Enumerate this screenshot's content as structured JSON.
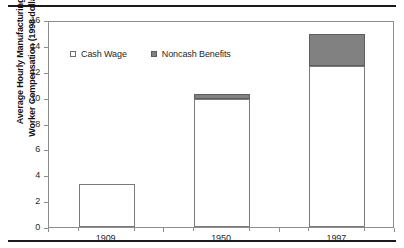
{
  "chart_data": {
    "type": "bar",
    "stacked": true,
    "title": "",
    "subtitle": "",
    "xlabel": "",
    "ylabel": "Average Hourly Manufacturing Worker Compensation (1998 dollars)",
    "ylabel_lines": [
      "Average Hourly Manufacturing",
      "Worker Compensation (1998 dollars)"
    ],
    "categories": [
      "1909",
      "1950",
      "1997"
    ],
    "series": [
      {
        "name": "Cash Wage",
        "values": [
          3.35,
          9.9,
          12.45
        ],
        "color": "#ffffff"
      },
      {
        "name": "Noncash Benefits",
        "values": [
          0.0,
          0.4,
          2.45
        ],
        "color": "#818181"
      }
    ],
    "totals": [
      3.35,
      10.3,
      14.9
    ],
    "ylim": [
      0,
      16
    ],
    "yticks": [
      0,
      2,
      4,
      6,
      8,
      10,
      12,
      14,
      16
    ],
    "ytick_labels": [
      "0",
      "2",
      "4",
      "6",
      "8",
      "10",
      "12",
      "14",
      "16"
    ],
    "grid": false,
    "legend_position": "top-left-inside",
    "legend": [
      "Cash Wage",
      "Noncash Benefits"
    ]
  },
  "legend": {
    "entries": [
      {
        "label": "Cash Wage",
        "marker": "hollow-square-marker"
      },
      {
        "label": "Noncash Benefits",
        "marker": "filled-square-marker"
      }
    ]
  },
  "axes": {
    "y_title_line1": "Average Hourly Manufacturing",
    "y_title_line2": "Worker Compensation (1998 dollars)"
  },
  "colors": {
    "cash_wage": "#ffffff",
    "noncash_benefits": "#818181",
    "bar_outline": "#7a7a7a",
    "axis": "#8d8d8d",
    "rule": "#1a1a1a",
    "text": "#1f1f1f",
    "background": "#ffffff"
  }
}
